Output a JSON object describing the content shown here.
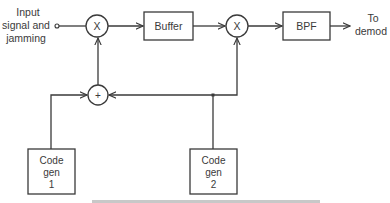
{
  "diagram": {
    "type": "block-diagram",
    "input": {
      "label_lines": [
        "Input",
        "signal and",
        "jamming"
      ]
    },
    "output": {
      "label_lines": [
        "To",
        "demod"
      ]
    },
    "blocks": {
      "mixer1": {
        "symbol": "X"
      },
      "buffer": {
        "label": "Buffer"
      },
      "mixer2": {
        "symbol": "X"
      },
      "bpf": {
        "label": "BPF"
      },
      "summer": {
        "symbol": "+"
      },
      "codegen1": {
        "label_lines": [
          "Code",
          "gen",
          "1"
        ]
      },
      "codegen2": {
        "label_lines": [
          "Code",
          "gen",
          "2"
        ]
      }
    },
    "connections": [
      {
        "from": "input",
        "to": "mixer1"
      },
      {
        "from": "mixer1",
        "to": "buffer"
      },
      {
        "from": "buffer",
        "to": "mixer2"
      },
      {
        "from": "mixer2",
        "to": "bpf"
      },
      {
        "from": "bpf",
        "to": "output"
      },
      {
        "from": "codegen1",
        "to": "summer"
      },
      {
        "from": "codegen2",
        "to": "summer"
      },
      {
        "from": "codegen2",
        "to": "mixer2"
      },
      {
        "from": "summer",
        "to": "mixer1"
      }
    ],
    "caption_partial": "Figure (caption cut off)"
  }
}
